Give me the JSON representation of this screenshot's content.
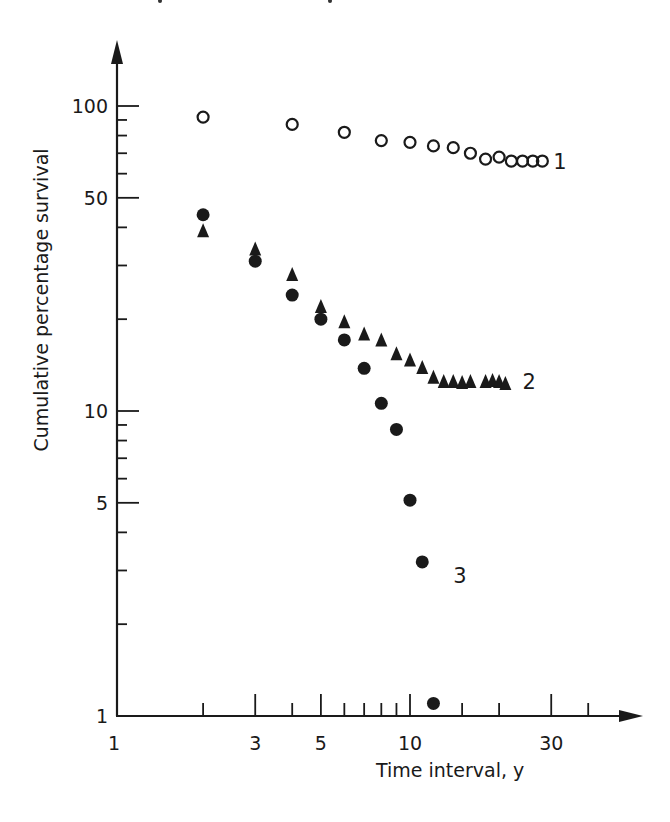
{
  "chart_data": {
    "type": "scatter",
    "title": "",
    "xlabel": "Time interval, y",
    "ylabel": "Cumulative percentage survival",
    "xscale": "log",
    "yscale": "log",
    "xlim": [
      1,
      50
    ],
    "ylim": [
      1,
      130
    ],
    "grid": false,
    "legend": "none (series numbered 1, 2, 3 at line ends)",
    "x_ticks": [
      {
        "value": 1,
        "label": "1",
        "major": true
      },
      {
        "value": 2,
        "label": "",
        "major": false
      },
      {
        "value": 3,
        "label": "3",
        "major": true
      },
      {
        "value": 4,
        "label": "",
        "major": false
      },
      {
        "value": 5,
        "label": "5",
        "major": true
      },
      {
        "value": 6,
        "label": "",
        "major": false
      },
      {
        "value": 7,
        "label": "",
        "major": false
      },
      {
        "value": 8,
        "label": "",
        "major": false
      },
      {
        "value": 9,
        "label": "",
        "major": false
      },
      {
        "value": 10,
        "label": "10",
        "major": true
      },
      {
        "value": 15,
        "label": "",
        "major": false
      },
      {
        "value": 20,
        "label": "",
        "major": false
      },
      {
        "value": 30,
        "label": "30",
        "major": true
      },
      {
        "value": 40,
        "label": "",
        "major": false
      }
    ],
    "y_ticks": [
      {
        "value": 1,
        "label": "1",
        "major": true
      },
      {
        "value": 2,
        "label": "",
        "major": false
      },
      {
        "value": 3,
        "label": "",
        "major": false
      },
      {
        "value": 4,
        "label": "",
        "major": false
      },
      {
        "value": 5,
        "label": "5",
        "major": true
      },
      {
        "value": 6,
        "label": "",
        "major": false
      },
      {
        "value": 7,
        "label": "",
        "major": false
      },
      {
        "value": 8,
        "label": "",
        "major": false
      },
      {
        "value": 9,
        "label": "",
        "major": false
      },
      {
        "value": 10,
        "label": "10",
        "major": true
      },
      {
        "value": 20,
        "label": "",
        "major": false
      },
      {
        "value": 30,
        "label": "",
        "major": false
      },
      {
        "value": 40,
        "label": "",
        "major": false
      },
      {
        "value": 50,
        "label": "50",
        "major": true
      },
      {
        "value": 60,
        "label": "",
        "major": false
      },
      {
        "value": 70,
        "label": "",
        "major": false
      },
      {
        "value": 80,
        "label": "",
        "major": false
      },
      {
        "value": 90,
        "label": "",
        "major": false
      },
      {
        "value": 100,
        "label": "100",
        "major": true
      }
    ],
    "series": [
      {
        "name": "1",
        "marker": "open-circle",
        "x": [
          2,
          4,
          6,
          8,
          10,
          12,
          14,
          16,
          18,
          20,
          22,
          24,
          26,
          28
        ],
        "y": [
          92,
          87,
          82,
          77,
          76,
          74,
          73,
          70,
          67,
          68,
          66,
          66,
          66,
          66
        ],
        "label_pos": {
          "x": 30,
          "y": 66
        }
      },
      {
        "name": "2",
        "marker": "filled-triangle",
        "x": [
          2,
          3,
          4,
          5,
          6,
          7,
          8,
          9,
          10,
          11,
          12,
          13,
          14,
          15,
          16,
          18,
          19,
          20,
          21
        ],
        "y": [
          39,
          34,
          28,
          22,
          19.6,
          17.9,
          17.1,
          15.4,
          14.7,
          13.9,
          12.9,
          12.5,
          12.5,
          12.4,
          12.5,
          12.5,
          12.6,
          12.5,
          12.3
        ],
        "label_pos": {
          "x": 24,
          "y": 12.5
        }
      },
      {
        "name": "3",
        "marker": "filled-circle",
        "x": [
          2,
          3,
          4,
          5,
          6,
          7,
          8,
          9,
          10,
          11,
          12
        ],
        "y": [
          44,
          31,
          24,
          20,
          17.1,
          13.8,
          10.6,
          8.7,
          5.1,
          3.2,
          1.1
        ],
        "label_pos": {
          "x": 14,
          "y": 2.9
        }
      }
    ]
  },
  "labels": {
    "xlabel": "Time interval, y",
    "ylabel": "Cumulative percentage survival"
  },
  "colors": {
    "ink": "#1a1a1a",
    "background": "#ffffff"
  }
}
